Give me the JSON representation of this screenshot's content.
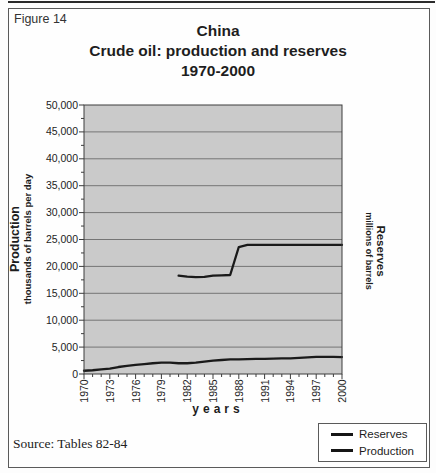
{
  "figure_label": "Figure 14",
  "source_note": "Source: Tables 82-84",
  "chart_data": {
    "type": "line",
    "title_lines": [
      "China",
      "Crude oil: production and reserves",
      "1970-2000"
    ],
    "xlabel": "years",
    "left_axis": {
      "title": "Production",
      "subtitle": "thousands of barrels per day"
    },
    "right_axis": {
      "title": "Reserves",
      "subtitle": "millions of barrels"
    },
    "x_range": [
      1970,
      2000
    ],
    "y_range": [
      0,
      50000
    ],
    "y_tick_step": 5000,
    "y_minor_tick_step": 2500,
    "x_major_ticks": [
      1970,
      1973,
      1976,
      1979,
      1982,
      1985,
      1988,
      1991,
      1994,
      1997,
      2000
    ],
    "x_minor_tick_step": 1,
    "grid": true,
    "legend_position": "bottom-right",
    "plot_bg": "#cacaca",
    "grid_color": "#757575",
    "axis_color": "#3c3c3c",
    "line_color": "#1a1a1a",
    "series": [
      {
        "name": "Reserves",
        "x": [
          1981,
          1982,
          1983,
          1984,
          1985,
          1986,
          1987,
          1988,
          1989,
          1990,
          1991,
          1992,
          1993,
          1994,
          1995,
          1996,
          1997,
          1998,
          1999,
          2000
        ],
        "values": [
          18300,
          18100,
          18000,
          18050,
          18300,
          18350,
          18400,
          23600,
          24000,
          24000,
          24000,
          24000,
          24000,
          24000,
          24000,
          24000,
          24000,
          24000,
          24000,
          24000
        ]
      },
      {
        "name": "Production",
        "x": [
          1970,
          1971,
          1972,
          1973,
          1974,
          1975,
          1976,
          1977,
          1978,
          1979,
          1980,
          1981,
          1982,
          1983,
          1984,
          1985,
          1986,
          1987,
          1988,
          1989,
          1990,
          1991,
          1992,
          1993,
          1994,
          1995,
          1996,
          1997,
          1998,
          1999,
          2000
        ],
        "values": [
          600,
          700,
          850,
          1000,
          1300,
          1500,
          1700,
          1850,
          2000,
          2100,
          2100,
          2000,
          2000,
          2100,
          2300,
          2500,
          2600,
          2700,
          2700,
          2750,
          2800,
          2800,
          2850,
          2900,
          2900,
          3000,
          3100,
          3200,
          3200,
          3200,
          3150
        ]
      }
    ]
  }
}
